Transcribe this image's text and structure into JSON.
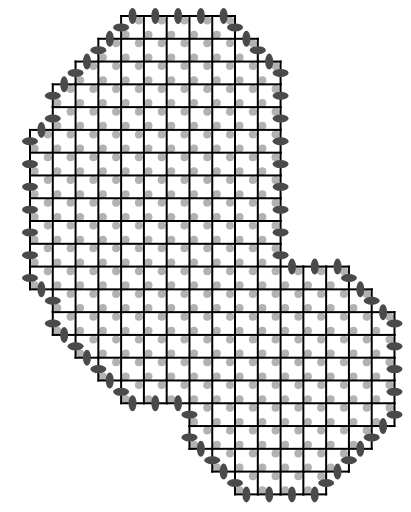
{
  "diagram": {
    "title": "",
    "kind": "lattice-region-with-boundary-markers",
    "canvas": {
      "width": 411,
      "height": 512,
      "background": "#ffffff"
    },
    "grid": {
      "origin_x": 30,
      "origin_y": 16,
      "cell_size": 22.78,
      "columns": 16,
      "rows": 21,
      "line_color": "#000000",
      "line_width": 2
    },
    "row_spans": [
      {
        "row": 0,
        "col_start": 4,
        "col_end": 9
      },
      {
        "row": 1,
        "col_start": 3,
        "col_end": 10
      },
      {
        "row": 2,
        "col_start": 2,
        "col_end": 11
      },
      {
        "row": 3,
        "col_start": 1,
        "col_end": 11
      },
      {
        "row": 4,
        "col_start": 1,
        "col_end": 11
      },
      {
        "row": 5,
        "col_start": 0,
        "col_end": 11
      },
      {
        "row": 6,
        "col_start": 0,
        "col_end": 11
      },
      {
        "row": 7,
        "col_start": 0,
        "col_end": 11
      },
      {
        "row": 8,
        "col_start": 0,
        "col_end": 11
      },
      {
        "row": 9,
        "col_start": 0,
        "col_end": 11
      },
      {
        "row": 10,
        "col_start": 0,
        "col_end": 11
      },
      {
        "row": 11,
        "col_start": 0,
        "col_end": 14
      },
      {
        "row": 12,
        "col_start": 1,
        "col_end": 15
      },
      {
        "row": 13,
        "col_start": 1,
        "col_end": 16
      },
      {
        "row": 14,
        "col_start": 2,
        "col_end": 16
      },
      {
        "row": 15,
        "col_start": 3,
        "col_end": 16
      },
      {
        "row": 16,
        "col_start": 4,
        "col_end": 16
      },
      {
        "row": 17,
        "col_start": 7,
        "col_end": 16
      },
      {
        "row": 18,
        "col_start": 7,
        "col_end": 15
      },
      {
        "row": 19,
        "col_start": 8,
        "col_end": 14
      },
      {
        "row": 20,
        "col_start": 9,
        "col_end": 13
      }
    ],
    "cell_dots": {
      "color": "#b2b2b2",
      "radius": 4,
      "positions": [
        {
          "name": "top-right",
          "dx": 0.78,
          "dy": 0.2
        },
        {
          "name": "bottom-left",
          "dx": 0.2,
          "dy": 0.82
        }
      ]
    },
    "boundary_markers": {
      "color": "#4a4a4a",
      "long_radius": 8,
      "short_radius": 4,
      "orientation": "perpendicular-to-boundary-edge",
      "placement": "midpoint-of-each-boundary-segment"
    }
  }
}
